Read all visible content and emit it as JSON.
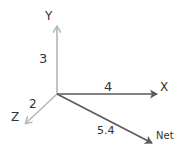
{
  "diagram": {
    "type": "vector-components-3d",
    "origin": [
      57,
      94
    ],
    "colors": {
      "light_axis": "#b4b4b4",
      "dark_axis": "#5a5a5a",
      "text": "#333333"
    },
    "axes": [
      {
        "id": "y",
        "axis_label": "Y",
        "magnitude_label": "3"
      },
      {
        "id": "x",
        "axis_label": "X",
        "magnitude_label": "4"
      },
      {
        "id": "z",
        "axis_label": "Z",
        "magnitude_label": "2"
      }
    ],
    "resultant": {
      "axis_label": "Net",
      "magnitude_label": "5.4"
    }
  }
}
